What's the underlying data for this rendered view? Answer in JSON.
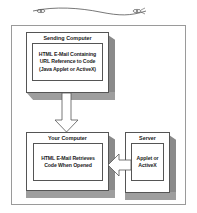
{
  "diagram": {
    "nodes": {
      "sending_computer": {
        "title": "Sending Computer",
        "content_lines": [
          "HTML E-Mail Containing",
          "URL Reference to Code",
          "(Java Applet or ActiveX)"
        ]
      },
      "your_computer": {
        "title": "Your Computer",
        "content_lines": [
          "HTML E-Mail Retrieves",
          "Code When Opened"
        ]
      },
      "server": {
        "title": "Server",
        "content_lines": [
          "Applet or",
          "ActiveX"
        ]
      }
    },
    "edges": [
      {
        "from": "Sending Computer",
        "to": "Your Computer",
        "direction": "down"
      },
      {
        "from": "Server",
        "to": "Your Computer",
        "direction": "left"
      }
    ],
    "colors": {
      "shade_side": "#8a8a8a",
      "shade_bottom": "#9e9e9e",
      "border": "#555555",
      "frame": "#9a9a9a"
    }
  }
}
